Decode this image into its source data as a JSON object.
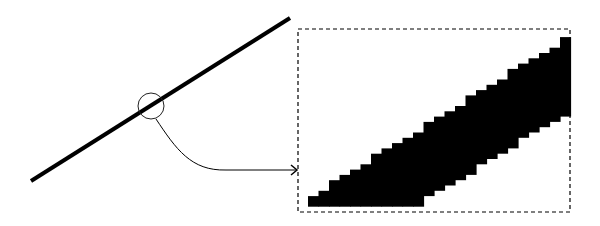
{
  "diagram": {
    "title": "",
    "colors": {
      "background": "#ffffff",
      "stroke": "#000000"
    },
    "line": {
      "x1": 31,
      "y1": 181,
      "x2": 290,
      "y2": 18,
      "width": 4
    },
    "magnifier_circle": {
      "cx": 151,
      "cy": 106,
      "r": 13
    },
    "connector": {
      "from": [
        156,
        119
      ],
      "to": [
        297,
        170
      ],
      "label": ""
    },
    "zoom_box": {
      "x": 298,
      "y": 29,
      "width": 272,
      "height": 183,
      "style": "dashed"
    },
    "pixel_band": {
      "description": "staircase-aliased black band rising left-to-right"
    }
  }
}
